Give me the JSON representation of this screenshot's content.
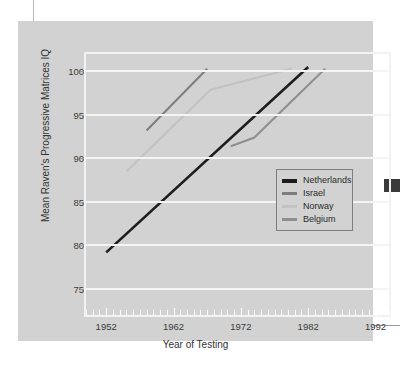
{
  "figure": {
    "background_color": "#d2d2d2",
    "plot_border_color": "#f2f2f2",
    "gridline_color": "#f4f4f4"
  },
  "chart_data": {
    "type": "line",
    "title": "",
    "xlabel": "Year of Testing",
    "ylabel": "Mean Raven's Progressive Matrices IQ",
    "xlim": [
      1949,
      1994
    ],
    "ylim": [
      72,
      102
    ],
    "xticks": [
      1952,
      1962,
      1972,
      1982,
      1992
    ],
    "xtick_labels": [
      "1952",
      "1962",
      "1972",
      "1982",
      "1992"
    ],
    "yticks": [
      75,
      80,
      85,
      90,
      95,
      100
    ],
    "ytick_labels": [
      "75",
      "80",
      "85",
      "90",
      "95",
      "100"
    ],
    "minor_xtick_step": 1,
    "grid": "horizontal",
    "legend_position": "lower-right-inside",
    "series": [
      {
        "name": "Netherlands",
        "color": "#1d1d1d",
        "width": 2.6,
        "points": [
          [
            1952,
            79.2
          ],
          [
            1982,
            100.5
          ]
        ]
      },
      {
        "name": "Israel",
        "color": "#7d7d7d",
        "width": 2.0,
        "points": [
          [
            1958,
            93.2
          ],
          [
            1967,
            100.3
          ]
        ]
      },
      {
        "name": "Norway",
        "color": "#c2c2c2",
        "width": 2.0,
        "points": [
          [
            1955,
            88.5
          ],
          [
            1967.5,
            97.9
          ],
          [
            1979.5,
            100.3
          ]
        ]
      },
      {
        "name": "Belgium",
        "color": "#8f8f8f",
        "width": 2.0,
        "points": [
          [
            1970.5,
            91.4
          ],
          [
            1974,
            92.4
          ],
          [
            1984.5,
            100.3
          ]
        ]
      }
    ]
  },
  "legend": {
    "entries": [
      {
        "label": "Netherlands",
        "color": "#1d1d1d"
      },
      {
        "label": "Israel",
        "color": "#7d7d7d"
      },
      {
        "label": "Norway",
        "color": "#c2c2c2"
      },
      {
        "label": "Belgium",
        "color": "#8f8f8f"
      }
    ]
  }
}
